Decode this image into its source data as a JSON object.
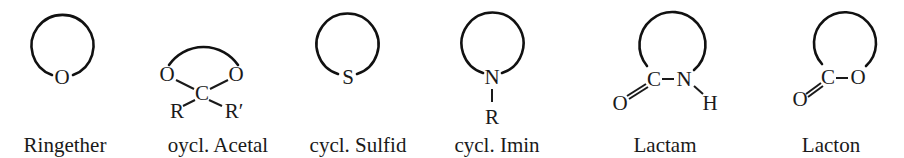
{
  "figure": {
    "structures": [
      {
        "id": "ringether",
        "label": "Ringether",
        "atoms": [
          "O"
        ]
      },
      {
        "id": "acetal",
        "label": "oycl. Acetal",
        "atoms": [
          "O",
          "O",
          "C",
          "R",
          "R′"
        ]
      },
      {
        "id": "sulfid",
        "label": "cycl. Sulfid",
        "atoms": [
          "S"
        ]
      },
      {
        "id": "imin",
        "label": "cycl. Imin",
        "atoms": [
          "N",
          "R"
        ]
      },
      {
        "id": "lactam",
        "label": "Lactam",
        "atoms": [
          "C",
          "N",
          "O",
          "H"
        ]
      },
      {
        "id": "lacton",
        "label": "Lacton",
        "atoms": [
          "C",
          "O",
          "O"
        ]
      }
    ],
    "colors": {
      "ink": "#1a1a1a",
      "background": "#ffffff"
    }
  }
}
